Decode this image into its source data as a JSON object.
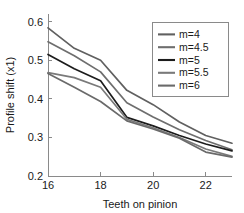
{
  "chart_data": {
    "type": "line",
    "title": "",
    "xlabel": "Teeth on pinion",
    "ylabel": "Profile shift (x1)",
    "xlim": [
      16,
      23
    ],
    "ylim": [
      0.2,
      0.62
    ],
    "grid": false,
    "legend_position": "top-right",
    "xticks": [
      "16",
      "18",
      "20",
      "22"
    ],
    "xtick_values": [
      16,
      18,
      20,
      22
    ],
    "yticks": [
      "0.2",
      "0.3",
      "0.4",
      "0.5",
      "0.6"
    ],
    "ytick_values": [
      0.2,
      0.3,
      0.4,
      0.5,
      0.6
    ],
    "x": [
      16,
      17,
      18,
      19,
      20,
      21,
      22,
      23
    ],
    "series": [
      {
        "name": "m=4",
        "color": "#606060",
        "values": [
          0.584,
          0.531,
          0.5,
          0.422,
          0.385,
          0.34,
          0.305,
          0.285
        ]
      },
      {
        "name": "m=4.5",
        "color": "#6e6e6e",
        "values": [
          0.548,
          0.512,
          0.47,
          0.39,
          0.353,
          0.32,
          0.292,
          0.268
        ]
      },
      {
        "name": "m=5",
        "color": "#1c1c1c",
        "values": [
          0.515,
          0.478,
          0.447,
          0.352,
          0.33,
          0.305,
          0.283,
          0.265
        ]
      },
      {
        "name": "m=5.5",
        "color": "#7a7a7a",
        "values": [
          0.468,
          0.455,
          0.43,
          0.347,
          0.325,
          0.3,
          0.27,
          0.251
        ]
      },
      {
        "name": "m=6",
        "color": "#6a6a6a",
        "values": [
          0.466,
          0.43,
          0.393,
          0.343,
          0.322,
          0.298,
          0.262,
          0.249
        ]
      }
    ]
  }
}
